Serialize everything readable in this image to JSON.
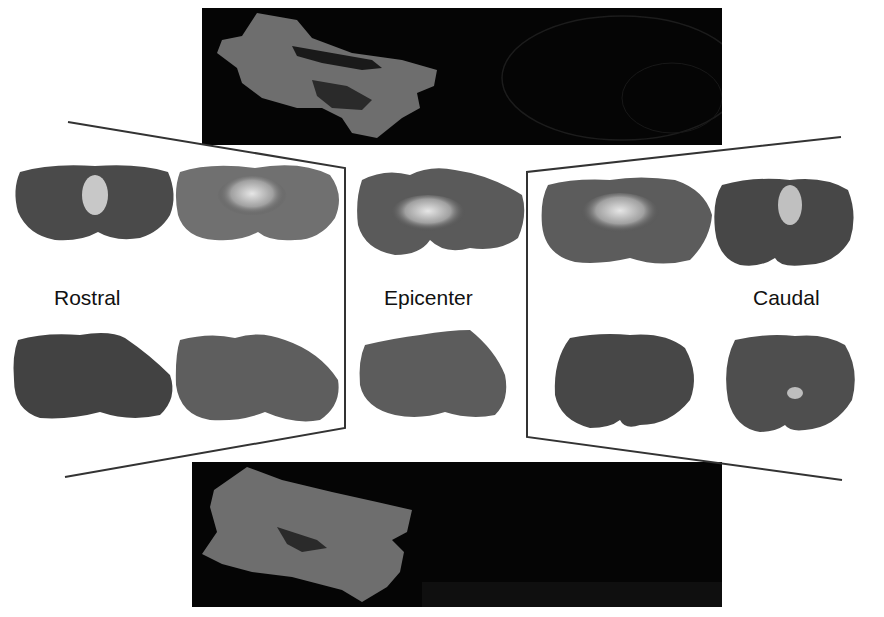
{
  "figure": {
    "top_panel": {
      "description": "3D lesion reconstruction (top view)",
      "lesion_color": "#6e6e6e",
      "background": "#050505"
    },
    "bottom_panel": {
      "description": "3D lesion reconstruction (bottom view)",
      "lesion_color": "#6e6e6e",
      "background": "#050505"
    },
    "labels": {
      "rostral": "Rostral",
      "epicenter": "Epicenter",
      "caudal": "Caudal"
    },
    "groups": [
      {
        "name": "rostral",
        "sections": 4
      },
      {
        "name": "epicenter",
        "sections": 2
      },
      {
        "name": "caudal",
        "sections": 4
      }
    ],
    "colors": {
      "tissue": "#4a4a4a",
      "lesion": "#d8d8d8",
      "line": "#333333"
    }
  }
}
